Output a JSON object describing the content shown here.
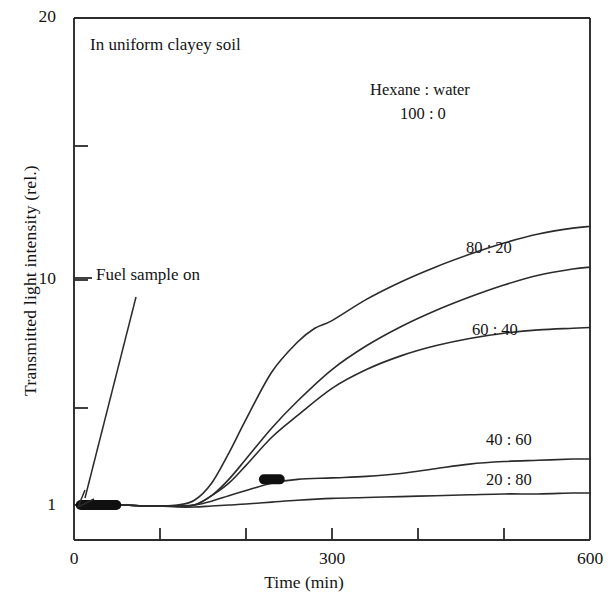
{
  "chart_data": {
    "type": "line",
    "title": "In uniform clayey soil",
    "xlabel": "Time (min)",
    "ylabel": "Transmitted light intensity (rel.)",
    "xlim": [
      0,
      600
    ],
    "ylim": [
      1,
      20
    ],
    "yscale": "log",
    "grid": false,
    "legend_position": "inline-curve-labels",
    "legend_header": "Hexane : water",
    "xticks": [
      0,
      100,
      200,
      300,
      400,
      500,
      600
    ],
    "xtick_labels": [
      "0",
      "300",
      "600"
    ],
    "ytick_labels": [
      "1",
      "10",
      "20"
    ],
    "annotations": [
      {
        "text": "Fuel sample on",
        "points_to_x": 5,
        "points_to_y": 1.0
      },
      {
        "text": "Hexane : water",
        "role": "series-group-header"
      }
    ],
    "series": [
      {
        "name": "100 : 0",
        "label": "100 : 0",
        "x": [
          0,
          20,
          40,
          60,
          80,
          100,
          120,
          140,
          160,
          180,
          200,
          230,
          260,
          280,
          300,
          340,
          380,
          420,
          460,
          500,
          540,
          580,
          600
        ],
        "y": [
          1.0,
          1.0,
          1.0,
          1.0,
          0.99,
          0.99,
          1.0,
          1.05,
          1.25,
          1.7,
          2.4,
          3.9,
          5.3,
          6.1,
          6.6,
          8.2,
          9.8,
          11.4,
          13.0,
          14.6,
          16.0,
          17.0,
          17.3
        ]
      },
      {
        "name": "80 : 20",
        "label": "80 : 20",
        "x": [
          0,
          20,
          40,
          60,
          80,
          100,
          120,
          140,
          160,
          180,
          200,
          230,
          260,
          300,
          340,
          380,
          420,
          460,
          500,
          540,
          580,
          600
        ],
        "y": [
          1.0,
          1.0,
          1.0,
          1.0,
          0.99,
          0.99,
          0.99,
          1.0,
          1.1,
          1.3,
          1.6,
          2.2,
          2.9,
          4.0,
          5.1,
          6.2,
          7.3,
          8.4,
          9.5,
          10.5,
          11.2,
          11.4
        ]
      },
      {
        "name": "60 : 40",
        "label": "60 : 40",
        "x": [
          0,
          20,
          40,
          60,
          80,
          100,
          120,
          140,
          160,
          180,
          200,
          230,
          260,
          300,
          340,
          380,
          420,
          460,
          500,
          540,
          580,
          600
        ],
        "y": [
          1.0,
          1.0,
          1.0,
          1.0,
          0.99,
          0.99,
          0.99,
          1.0,
          1.1,
          1.25,
          1.5,
          2.0,
          2.5,
          3.3,
          4.0,
          4.6,
          5.1,
          5.5,
          5.8,
          6.0,
          6.1,
          6.15
        ]
      },
      {
        "name": "40 : 60",
        "label": "40 : 60",
        "x": [
          0,
          20,
          40,
          60,
          80,
          100,
          120,
          140,
          160,
          180,
          200,
          230,
          260,
          300,
          340,
          380,
          420,
          460,
          500,
          540,
          580,
          600
        ],
        "y": [
          1.0,
          1.0,
          1.0,
          1.0,
          0.99,
          0.99,
          0.99,
          1.0,
          1.04,
          1.1,
          1.16,
          1.25,
          1.3,
          1.32,
          1.34,
          1.38,
          1.45,
          1.52,
          1.56,
          1.58,
          1.6,
          1.6
        ]
      },
      {
        "name": "20 : 80",
        "label": "20 : 80",
        "x": [
          0,
          20,
          40,
          60,
          80,
          100,
          120,
          140,
          160,
          180,
          200,
          230,
          260,
          300,
          340,
          380,
          420,
          460,
          500,
          540,
          580,
          600
        ],
        "y": [
          1.0,
          1.0,
          1.0,
          1.0,
          0.99,
          0.99,
          0.98,
          0.98,
          0.99,
          1.0,
          1.01,
          1.03,
          1.05,
          1.07,
          1.08,
          1.09,
          1.1,
          1.11,
          1.12,
          1.12,
          1.13,
          1.13
        ]
      }
    ],
    "marker_clusters": [
      {
        "x_start": 2,
        "x_end": 55,
        "y": 1.0
      },
      {
        "x_start": 215,
        "x_end": 245,
        "y": 1.3
      }
    ]
  },
  "axes": {
    "y_labels": [
      {
        "text": "20",
        "top": 6
      },
      {
        "text": "10",
        "top": 268
      },
      {
        "text": "1",
        "top": 494
      }
    ],
    "x_labels": [
      {
        "text": "0",
        "left": 58
      },
      {
        "text": "300",
        "left": 300
      },
      {
        "text": "600",
        "left": 560
      }
    ]
  },
  "annotations": {
    "plot_title": "In uniform clayey soil",
    "fuel_sample": "Fuel sample on",
    "series_header": "Hexane : water",
    "s_100_0": "100 : 0",
    "s_80_20": "80 : 20",
    "s_60_40": "60 : 40",
    "s_40_60": "40 : 60",
    "s_20_80": "20 : 80"
  },
  "labels": {
    "x_axis_title": "Time (min)",
    "y_axis_title": "Transmitted light intensity (rel.)"
  },
  "colors": {
    "ink": "#2b2b2b",
    "background": "#ffffff",
    "marker": "#101010"
  }
}
